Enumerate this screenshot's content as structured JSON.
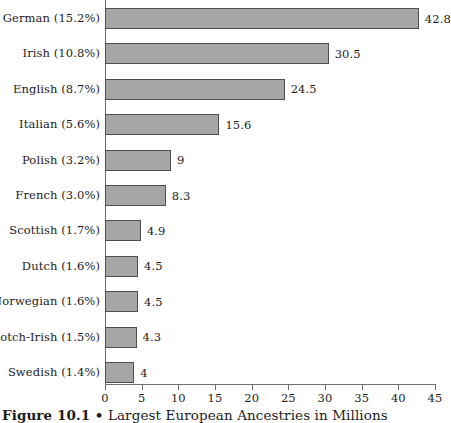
{
  "caption": {
    "figure_number": "Figure 10.1",
    "separator": "•",
    "title": "Largest European Ancestries in Millions",
    "full": "Figure 10.1 • Largest European Ancestries in Millions"
  },
  "colors": {
    "bar_fill": "#a6a6a6",
    "bar_stroke": "#4f4f4f",
    "axis": "#6e6e6e",
    "text": "#1c1c1c",
    "background": "#ffffff"
  },
  "chart_data": {
    "type": "bar",
    "orientation": "horizontal",
    "title": "Largest European Ancestries in Millions",
    "xlabel": "",
    "ylabel": "",
    "xlim": [
      0,
      45
    ],
    "xticks": [
      0,
      5,
      10,
      15,
      20,
      25,
      30,
      35,
      40,
      45
    ],
    "grid": false,
    "legend": null,
    "value_labels_shown": true,
    "categories": [
      "German (15.2%)",
      "Irish (10.8%)",
      "English (8.7%)",
      "Italian (5.6%)",
      "Polish (3.2%)",
      "French (3.0%)",
      "Scottish (1.7%)",
      "Dutch (1.6%)",
      "Norwegian (1.6%)",
      "Scotch-Irish (1.5%)",
      "Swedish (1.4%)"
    ],
    "values": [
      42.8,
      30.5,
      24.5,
      15.6,
      9,
      8.3,
      4.9,
      4.5,
      4.5,
      4.3,
      4
    ],
    "value_labels": [
      "42.8",
      "30.5",
      "24.5",
      "15.6",
      "9",
      "8.3",
      "4.9",
      "4.5",
      "4.5",
      "4.3",
      "4"
    ],
    "ancestry_names": [
      "German",
      "Irish",
      "English",
      "Italian",
      "Polish",
      "French",
      "Scottish",
      "Dutch",
      "Norwegian",
      "Scotch-Irish",
      "Swedish"
    ],
    "percent_labels": [
      "15.2%",
      "10.8%",
      "8.7%",
      "5.6%",
      "3.2%",
      "3.0%",
      "1.7%",
      "1.6%",
      "1.6%",
      "1.5%",
      "1.4%"
    ]
  }
}
